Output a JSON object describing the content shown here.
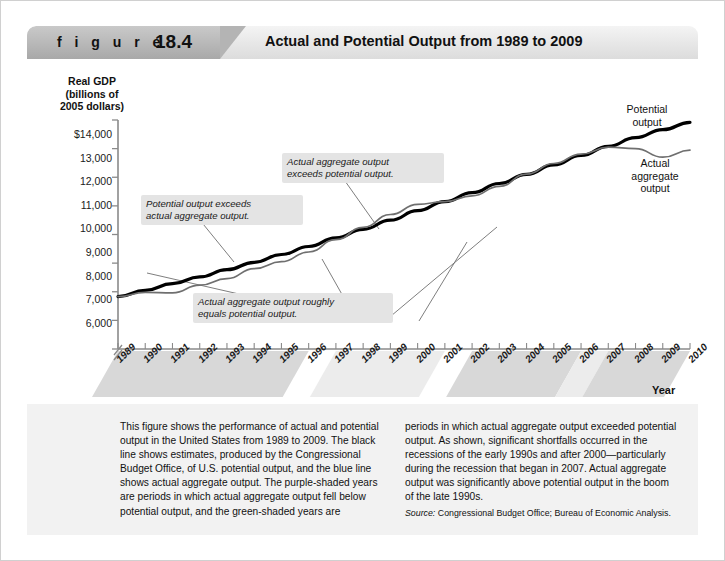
{
  "header": {
    "figure_word": "f i g u r e",
    "figure_number": "18.4",
    "title": "Actual and Potential Output from 1989 to 2009"
  },
  "axis": {
    "y_title": "Real GDP\n(billions of\n2005 dollars)",
    "y_title_line1": "Real GDP",
    "y_title_line2": "(billions of",
    "y_title_line3": "2005 dollars)",
    "x_title": "Year",
    "y_ticks": [
      "$14,000",
      "13,000",
      "12,000",
      "11,000",
      "10,000",
      "9,000",
      "8,000",
      "7,000",
      "6,000"
    ],
    "x_ticks": [
      "1989",
      "1990",
      "1991",
      "1992",
      "1993",
      "1994",
      "1995",
      "1996",
      "1997",
      "1998",
      "1999",
      "2000",
      "2001",
      "2002",
      "2003",
      "2004",
      "2005",
      "2006",
      "2007",
      "2008",
      "2009",
      "2010"
    ]
  },
  "series_labels": {
    "potential": "Potential\noutput",
    "potential_line1": "Potential",
    "potential_line2": "output",
    "actual": "Actual\naggregate\noutput",
    "actual_line1": "Actual",
    "actual_line2": "aggregate",
    "actual_line3": "output"
  },
  "callouts": [
    {
      "id": "potential-exceeds-actual",
      "text": "Potential output exceeds\nactual aggregate output."
    },
    {
      "id": "actual-exceeds-potential",
      "text": "Actual aggregate output\nexceeds potential output."
    },
    {
      "id": "roughly-equal",
      "text": "Actual aggregate output roughly\nequals potential output."
    }
  ],
  "caption": {
    "left": "This figure shows the performance of actual and potential output in the United States from 1989 to 2009. The black line shows estimates, produced by the Congressional Budget Office, of U.S. potential output, and the blue line shows actual aggregate output. The purple-shaded years are periods in which actual aggregate output fell below potential output, and the green-shaded years are",
    "right": "periods in which actual aggregate output exceeded potential output. As shown, significant shortfalls occurred in the recessions of the early 1990s and after 2000—particularly during the recession that began in 2007. Actual aggregate output was significantly above potential output in the boom of the late 1990s.",
    "source_prefix": "Source:",
    "source_text": "Congressional Budget Office; Bureau of Economic Analysis."
  },
  "colors": {
    "potential_line": "#000000",
    "actual_line": "#6f6f6f",
    "banner": "#e4e4e4",
    "banner_tab": "#b4b4b4",
    "caption_bg": "#f2f2f2",
    "callout_bg": "#e4e4e4",
    "shade_shortfall": "#d8d8d8",
    "shade_boom": "#ececec"
  },
  "chart_data": {
    "type": "line",
    "title": "Actual and Potential Output from 1989 to 2009",
    "xlabel": "Year",
    "ylabel": "Real GDP (billions of 2005 dollars)",
    "xlim": [
      1989,
      2010
    ],
    "ylim": [
      6000,
      14000
    ],
    "grid": false,
    "legend": "inline-labels",
    "x": [
      1989,
      1990,
      1991,
      1992,
      1993,
      1994,
      1995,
      1996,
      1997,
      1998,
      1999,
      2000,
      2001,
      2002,
      2003,
      2004,
      2005,
      2006,
      2007,
      2008,
      2009,
      2010
    ],
    "series": [
      {
        "name": "Potential output",
        "color": "#000000",
        "width": 3,
        "values": [
          7830,
          8050,
          8280,
          8520,
          8770,
          9030,
          9300,
          9580,
          9880,
          10180,
          10500,
          10830,
          11150,
          11460,
          11780,
          12100,
          12430,
          12760,
          13080,
          13380,
          13660,
          13920
        ]
      },
      {
        "name": "Actual aggregate output",
        "color": "#6f6f6f",
        "width": 1.6,
        "values": [
          7830,
          7980,
          7960,
          8230,
          8460,
          8810,
          9050,
          9390,
          9820,
          10250,
          10700,
          11050,
          11150,
          11350,
          11680,
          12110,
          12480,
          12810,
          13050,
          13000,
          12700,
          12950
        ]
      }
    ],
    "shaded_periods": [
      {
        "label": "purple-shaded (actual below potential)",
        "start": 1989,
        "end": 1996
      },
      {
        "label": "green-shaded (actual above potential)",
        "start": 1997,
        "end": 2001
      },
      {
        "label": "purple-shaded (actual below potential)",
        "start": 2002,
        "end": 2006
      },
      {
        "label": "green-shaded (actual above potential)",
        "start": 2006,
        "end": 2007
      },
      {
        "label": "purple-shaded (actual below potential)",
        "start": 2007,
        "end": 2010
      }
    ]
  }
}
